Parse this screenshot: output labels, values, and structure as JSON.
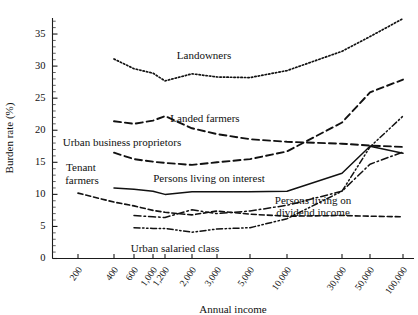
{
  "chart_data": {
    "type": "line",
    "title": "",
    "xlabel": "Annual income",
    "ylabel": "Burden rate (%)",
    "xscale": "log-ordinal",
    "grid": false,
    "legend_position": "inline-annotations",
    "ylim": [
      0,
      37.5
    ],
    "yticks": [
      0,
      5,
      10,
      15,
      20,
      25,
      30,
      35
    ],
    "ytick_labels": [
      "0",
      "5",
      "10",
      "15",
      "20",
      "25",
      "30",
      "35"
    ],
    "y_minor_step": 1,
    "categories": [
      "200",
      "400",
      "600",
      "1,000",
      "1,200",
      "2,000",
      "3,000",
      "5,000",
      "10,000",
      "30,000",
      "50,000",
      "100,000"
    ],
    "series": [
      {
        "name": "Landowners",
        "style": "dotted",
        "x": [
          "400",
          "600",
          "1,000",
          "1,200",
          "2,000",
          "3,000",
          "5,000",
          "10,000",
          "30,000",
          "50,000",
          "100,000"
        ],
        "values": [
          31.1,
          29.6,
          28.9,
          27.7,
          28.8,
          28.3,
          28.2,
          29.3,
          32.3,
          34.6,
          37.4
        ]
      },
      {
        "name": "Landed farmers",
        "style": "dashed-long",
        "x": [
          "400",
          "600",
          "1,000",
          "1,200",
          "2,000",
          "3,000",
          "5,000",
          "10,000",
          "30,000",
          "50,000",
          "100,000"
        ],
        "values": [
          21.4,
          21.0,
          21.5,
          22.2,
          20.3,
          19.4,
          18.6,
          18.2,
          17.9,
          17.6,
          17.4
        ]
      },
      {
        "name": "Urban business proprietors",
        "style": "dashed-long",
        "x": [
          "400",
          "600",
          "1,000",
          "1,200",
          "2,000",
          "3,000",
          "5,000",
          "10,000",
          "30,000",
          "50,000",
          "100,000"
        ],
        "values": [
          16.5,
          15.5,
          15.1,
          14.9,
          14.6,
          15.0,
          15.5,
          16.7,
          21.2,
          25.9,
          27.9
        ]
      },
      {
        "name": "Persons living on interest",
        "style": "solid",
        "x": [
          "400",
          "600",
          "1,000",
          "1,200",
          "2,000",
          "3,000",
          "5,000",
          "10,000",
          "30,000",
          "50,000",
          "100,000"
        ],
        "values": [
          11.0,
          10.8,
          10.5,
          10.0,
          10.4,
          10.4,
          10.4,
          10.5,
          13.3,
          17.5,
          16.4
        ]
      },
      {
        "name": "Tenant farmers",
        "style": "dashed-short",
        "x": [
          "200",
          "400",
          "600",
          "1,000",
          "1,200",
          "2,000",
          "3,000",
          "5,000",
          "10,000",
          "30,000",
          "50,000",
          "100,000"
        ],
        "values": [
          10.2,
          8.8,
          8.2,
          7.5,
          7.2,
          6.8,
          7.4,
          6.9,
          6.6,
          6.7,
          6.6,
          6.5
        ]
      },
      {
        "name": "Urban salaried class",
        "style": "dash-dot-dot",
        "x": [
          "600",
          "1,000",
          "1,200",
          "2,000",
          "3,000",
          "5,000",
          "10,000",
          "30,000",
          "50,000",
          "100,000"
        ],
        "values": [
          4.8,
          4.7,
          4.7,
          4.1,
          4.6,
          4.8,
          6.2,
          10.5,
          17.4,
          22.2
        ]
      },
      {
        "name": "Persons living on dividend income",
        "style": "dash-dot",
        "x": [
          "600",
          "1,000",
          "1,200",
          "2,000",
          "3,000",
          "5,000",
          "10,000",
          "30,000",
          "50,000",
          "100,000"
        ],
        "values": [
          6.7,
          6.5,
          6.4,
          7.6,
          7.0,
          7.4,
          8.3,
          10.5,
          14.7,
          16.6
        ]
      }
    ],
    "annotations": [
      {
        "text": "Landowners",
        "x": 204,
        "y": 59
      },
      {
        "text": "Landed farmers",
        "x": 205,
        "y": 122
      },
      {
        "text": "Urban business proprietors",
        "x": 122,
        "y": 146
      },
      {
        "text": "Tenant",
        "x": 81,
        "y": 171
      },
      {
        "text": "farmers",
        "x": 82,
        "y": 184
      },
      {
        "text": "Persons living on interest",
        "x": 209,
        "y": 182
      },
      {
        "text": "Urban salaried class",
        "x": 175,
        "y": 252
      },
      {
        "text": "Persons living on",
        "x": 313,
        "y": 204
      },
      {
        "text": "dividend income",
        "x": 313,
        "y": 216
      }
    ]
  }
}
